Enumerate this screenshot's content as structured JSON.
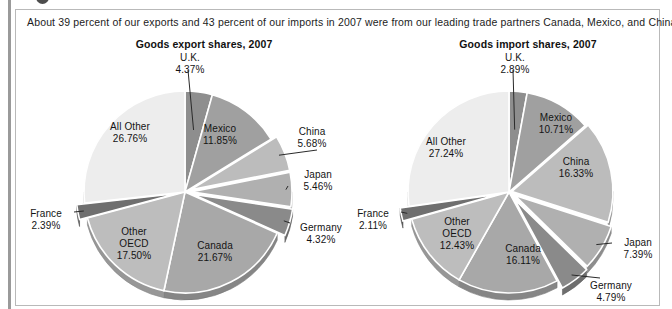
{
  "caption": "About 39 percent of our exports and 43 percent of our imports in 2007 were from our leading trade partners Canada, Mexico, and China.",
  "charts": [
    {
      "title": "Goods export shares, 2007",
      "id": "export",
      "slices": [
        {
          "label": "U.K.",
          "value": "4.37%",
          "pct": 4.37,
          "color": "#8e8e8e"
        },
        {
          "label": "Mexico",
          "value": "11.85%",
          "pct": 11.85,
          "color": "#a0a0a0"
        },
        {
          "label": "China",
          "value": "5.68%",
          "pct": 5.68,
          "color": "#bcbcbc"
        },
        {
          "label": "Japan",
          "value": "5.46%",
          "pct": 5.46,
          "color": "#b0b0b0"
        },
        {
          "label": "Germany",
          "value": "4.32%",
          "pct": 4.32,
          "color": "#8a8a8a"
        },
        {
          "label": "Canada",
          "value": "21.67%",
          "pct": 21.67,
          "color": "#a8a8a8"
        },
        {
          "label": "Other OECD",
          "value": "17.50%",
          "pct": 17.5,
          "color": "#bdbdbd"
        },
        {
          "label": "France",
          "value": "2.39%",
          "pct": 2.39,
          "color": "#6f6f6f"
        },
        {
          "label": "All Other",
          "value": "26.76%",
          "pct": 26.76,
          "color": "#ededed"
        }
      ]
    },
    {
      "title": "Goods import shares, 2007",
      "id": "import",
      "slices": [
        {
          "label": "U.K.",
          "value": "2.89%",
          "pct": 2.89,
          "color": "#8e8e8e"
        },
        {
          "label": "Mexico",
          "value": "10.71%",
          "pct": 10.71,
          "color": "#a0a0a0"
        },
        {
          "label": "China",
          "value": "16.33%",
          "pct": 16.33,
          "color": "#bcbcbc"
        },
        {
          "label": "Japan",
          "value": "7.39%",
          "pct": 7.39,
          "color": "#b0b0b0"
        },
        {
          "label": "Germany",
          "value": "4.79%",
          "pct": 4.79,
          "color": "#8a8a8a"
        },
        {
          "label": "Canada",
          "value": "16.11%",
          "pct": 16.11,
          "color": "#a8a8a8"
        },
        {
          "label": "Other OECD",
          "value": "12.43%",
          "pct": 12.43,
          "color": "#bdbdbd"
        },
        {
          "label": "France",
          "value": "2.11%",
          "pct": 2.11,
          "color": "#6f6f6f"
        },
        {
          "label": "All Other",
          "value": "27.24%",
          "pct": 27.24,
          "color": "#ededed"
        }
      ]
    }
  ],
  "chart_data": [
    {
      "type": "pie",
      "title": "Goods export shares, 2007",
      "categories": [
        "U.K.",
        "Mexico",
        "China",
        "Japan",
        "Germany",
        "Canada",
        "Other OECD",
        "France",
        "All Other"
      ],
      "values": [
        4.37,
        11.85,
        5.68,
        5.46,
        4.32,
        21.67,
        17.5,
        2.39,
        26.76
      ],
      "value_labels": [
        "4.37%",
        "11.85%",
        "5.68%",
        "5.46%",
        "4.32%",
        "21.67%",
        "17.50%",
        "2.39%",
        "26.76%"
      ],
      "unit": "percent",
      "total": 100.0,
      "legend": "none (slices directly labeled)",
      "grid": false
    },
    {
      "type": "pie",
      "title": "Goods import shares, 2007",
      "categories": [
        "U.K.",
        "Mexico",
        "China",
        "Japan",
        "Germany",
        "Canada",
        "Other OECD",
        "France",
        "All Other"
      ],
      "values": [
        2.89,
        10.71,
        16.33,
        7.39,
        4.79,
        16.11,
        12.43,
        2.11,
        27.24
      ],
      "value_labels": [
        "2.89%",
        "10.71%",
        "16.33%",
        "7.39%",
        "4.79%",
        "16.11%",
        "12.43%",
        "2.11%",
        "27.24%"
      ],
      "unit": "percent",
      "total": 100.0,
      "legend": "none (slices directly labeled)",
      "grid": false
    }
  ],
  "colors": {
    "panel_border": "#b9b9b9",
    "slice_outline": "#ffffff",
    "text": "#141414",
    "all_other": "#ededed",
    "france": "#6f6f6f"
  }
}
